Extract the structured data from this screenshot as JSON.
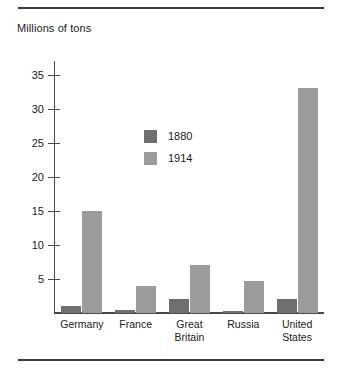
{
  "figure": {
    "axis_title": "Millions of tons"
  },
  "legend": {
    "entries": [
      {
        "label": "1880",
        "color": "#6f6f6f"
      },
      {
        "label": "1914",
        "color": "#9c9c9c"
      }
    ]
  },
  "chart_data": {
    "type": "bar",
    "title": "Millions of tons",
    "xlabel": "",
    "ylabel": "Millions of tons",
    "ylim": [
      0,
      37
    ],
    "grid": false,
    "legend_position": "inside-top-left",
    "yticks": [
      5,
      10,
      15,
      20,
      25,
      30,
      35
    ],
    "ytick_labels": [
      "5",
      "10",
      "15",
      "20",
      "25",
      "30",
      "35"
    ],
    "categories": [
      "Germany",
      "France",
      "Great Britain",
      "Russia",
      "United States"
    ],
    "category_lines": [
      [
        "Germany"
      ],
      [
        "France"
      ],
      [
        "Great",
        "Britain"
      ],
      [
        "Russia"
      ],
      [
        "United",
        "States"
      ]
    ],
    "series": [
      {
        "name": "1880",
        "color": "#6f6f6f",
        "values": [
          1,
          0.5,
          2,
          0.3,
          2
        ]
      },
      {
        "name": "1914",
        "color": "#9c9c9c",
        "values": [
          15,
          4,
          7,
          4.7,
          33
        ]
      }
    ]
  }
}
